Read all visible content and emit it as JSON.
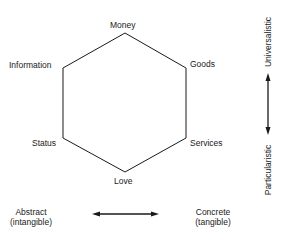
{
  "nodes": {
    "money": "Money",
    "goods": "Goods",
    "services": "Services",
    "love": "Love",
    "status": "Status",
    "information": "Information"
  },
  "axes": {
    "vertical_top": "Universalistic",
    "vertical_bottom": "Particularistic",
    "horizontal_left_line1": "Abstract",
    "horizontal_left_line2": "(intangible)",
    "horizontal_right_line1": "Concrete",
    "horizontal_right_line2": "(tangible)"
  },
  "colors": {
    "stroke": "#1a1a1a",
    "background": "#ffffff"
  }
}
